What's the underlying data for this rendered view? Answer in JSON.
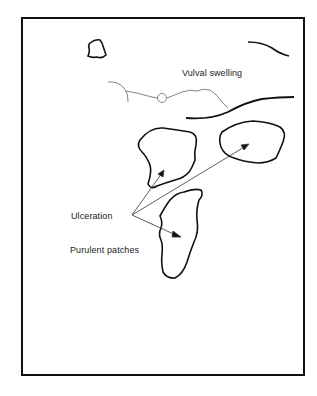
{
  "diagram": {
    "labels": {
      "vulval_swelling": "Vulval swelling",
      "ulceration": "Ulceration",
      "purulent_patches": "Purulent patches"
    },
    "colors": {
      "line": "#111111",
      "thin_line": "#555555",
      "text": "#222222",
      "background": "#ffffff"
    }
  }
}
